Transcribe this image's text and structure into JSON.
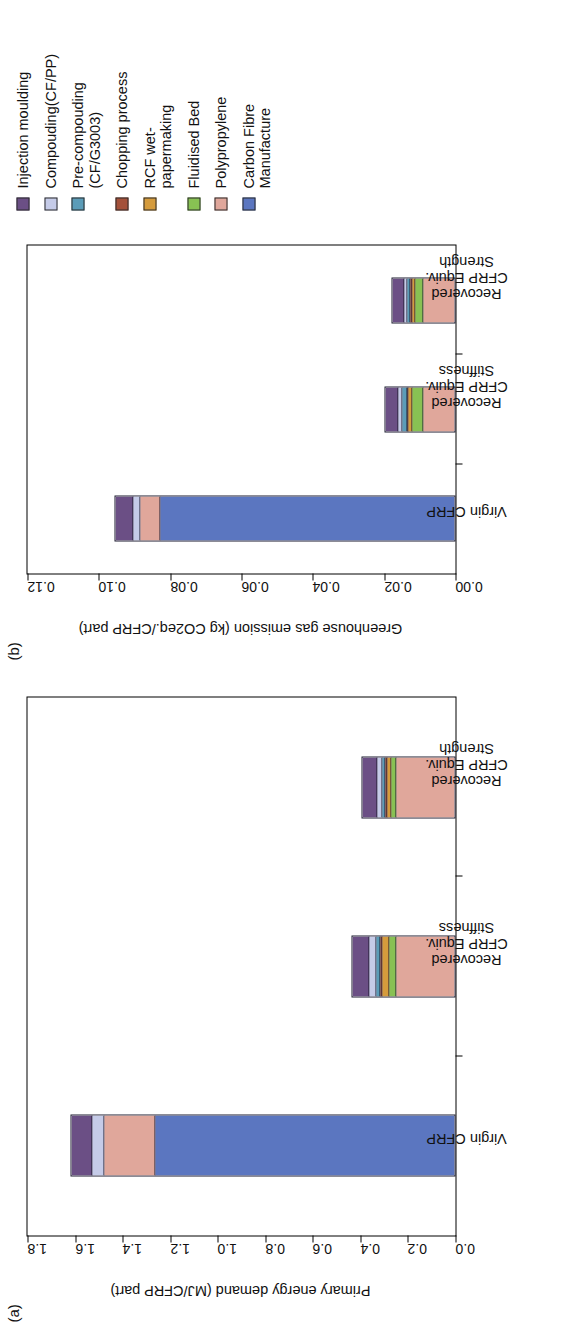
{
  "figure": {
    "panel_a_tag": "(a)",
    "panel_b_tag": "(b)"
  },
  "legend": {
    "items": [
      {
        "label": "Injection moulding",
        "color": "#6b4f85"
      },
      {
        "label": "Compouding(CF/PP)",
        "color": "#c5cbe8"
      },
      {
        "label": "Pre-compouding\n(CF/G3003)",
        "color": "#5b9cb8"
      },
      {
        "label": "Chopping process",
        "color": "#a4513a"
      },
      {
        "label": "RCF wet-\npapermaking",
        "color": "#d59b3c"
      },
      {
        "label": "Fluidised Bed",
        "color": "#88c153"
      },
      {
        "label": "Polypropylene",
        "color": "#e0a79b"
      },
      {
        "label": "Carbon Fibre\nManufacture",
        "color": "#5b76c0"
      }
    ]
  },
  "chart_data": [
    {
      "type": "bar",
      "panel": "(a)",
      "stacked": true,
      "orientation": "vertical",
      "title": "",
      "xlabel": "",
      "ylabel": "Primary energy demand (MJ/CFRP part)",
      "ylim": [
        0.0,
        1.8
      ],
      "yticks": [
        "0.0",
        "0.2",
        "0.4",
        "0.6",
        "0.8",
        "1.0",
        "1.2",
        "1.4",
        "1.6",
        "1.8"
      ],
      "ytick_values": [
        0.0,
        0.2,
        0.4,
        0.6,
        0.8,
        1.0,
        1.2,
        1.4,
        1.6,
        1.8
      ],
      "grid": false,
      "legend_position": "right",
      "categories": [
        "Virgin CFRP",
        "Recovered\nCFRP Equiv.\nStiffness",
        "Recovered\nCFRP Equiv.\nStrength"
      ],
      "series": [
        {
          "name": "Carbon Fibre Manufacture",
          "color": "#5b76c0",
          "values": [
            1.265,
            0.0,
            0.0
          ]
        },
        {
          "name": "Polypropylene",
          "color": "#e0a79b",
          "values": [
            0.215,
            0.25,
            0.25
          ]
        },
        {
          "name": "Fluidised Bed",
          "color": "#88c153",
          "values": [
            0.0,
            0.03,
            0.022
          ]
        },
        {
          "name": "RCF wet-papermaking",
          "color": "#d59b3c",
          "values": [
            0.0,
            0.028,
            0.018
          ]
        },
        {
          "name": "Chopping process",
          "color": "#a4513a",
          "values": [
            0.0,
            0.008,
            0.006
          ]
        },
        {
          "name": "Pre-compouding (CF/G3003)",
          "color": "#5b9cb8",
          "values": [
            0.0,
            0.018,
            0.013
          ]
        },
        {
          "name": "Compouding(CF/PP)",
          "color": "#c5cbe8",
          "values": [
            0.05,
            0.03,
            0.022
          ]
        },
        {
          "name": "Injection moulding",
          "color": "#6b4f85",
          "values": [
            0.09,
            0.075,
            0.065
          ]
        }
      ],
      "totals": [
        1.62,
        0.439,
        0.396
      ]
    },
    {
      "type": "bar",
      "panel": "(b)",
      "stacked": true,
      "orientation": "vertical",
      "title": "",
      "xlabel": "",
      "ylabel": "Greenhouse gas emission (kg CO2eq./CFRP part)",
      "ylim": [
        0.0,
        0.12
      ],
      "yticks": [
        "0.00",
        "0.02",
        "0.04",
        "0.06",
        "0.08",
        "0.10",
        "0.12"
      ],
      "ytick_values": [
        0.0,
        0.02,
        0.04,
        0.06,
        0.08,
        0.1,
        0.12
      ],
      "grid": false,
      "legend_position": "right",
      "categories": [
        "Virgin CFRP",
        "Recovered\nCFRP Equiv.\nStiffness",
        "Recovered\nCFRP Equiv.\nStrength"
      ],
      "series": [
        {
          "name": "Carbon Fibre Manufacture",
          "color": "#5b76c0",
          "values": [
            0.083,
            0.0,
            0.0
          ]
        },
        {
          "name": "Polypropylene",
          "color": "#e0a79b",
          "values": [
            0.0055,
            0.009,
            0.009
          ]
        },
        {
          "name": "Fluidised Bed",
          "color": "#88c153",
          "values": [
            0.0,
            0.003,
            0.0024
          ]
        },
        {
          "name": "RCF wet-papermaking",
          "color": "#d59b3c",
          "values": [
            0.0,
            0.0012,
            0.0009
          ]
        },
        {
          "name": "Chopping process",
          "color": "#a4513a",
          "values": [
            0.0,
            0.0005,
            0.0004
          ]
        },
        {
          "name": "Pre-compouding (CF/G3003)",
          "color": "#5b9cb8",
          "values": [
            0.0,
            0.0012,
            0.0009
          ]
        },
        {
          "name": "Compouding(CF/PP)",
          "color": "#c5cbe8",
          "values": [
            0.002,
            0.0013,
            0.001
          ]
        },
        {
          "name": "Injection moulding",
          "color": "#6b4f85",
          "values": [
            0.005,
            0.0038,
            0.0033
          ]
        }
      ],
      "totals": [
        0.0955,
        0.02,
        0.018
      ]
    }
  ]
}
